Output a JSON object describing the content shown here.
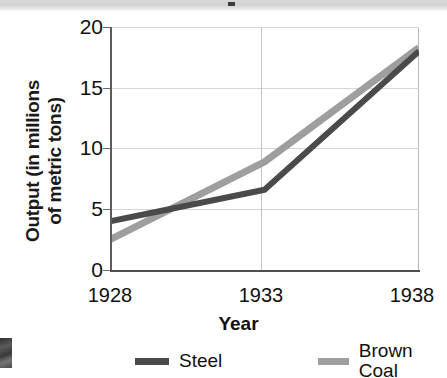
{
  "figure": {
    "title_band": {
      "visible": true,
      "note": "cut-off title strip"
    },
    "artifact": {
      "name": "scan-artifact"
    }
  },
  "chart_data": {
    "type": "line",
    "title": "",
    "xlabel": "Year",
    "ylabel": "Output (in millions of metric tons)",
    "ylabel_line1": "Output (in millions",
    "ylabel_line2": "of metric tons)",
    "x": [
      1928,
      1933,
      1938
    ],
    "categories": [
      "1928",
      "1933",
      "1938"
    ],
    "xticklabels": [
      "1928",
      "1933",
      "1938"
    ],
    "yticklabels": [
      "0",
      "5",
      "10",
      "15",
      "20"
    ],
    "yticks": [
      0,
      5,
      10,
      15,
      20
    ],
    "ylim": [
      0,
      20
    ],
    "xlim": [
      1928,
      1938
    ],
    "grid": true,
    "legend_position": "below",
    "series": [
      {
        "name": "Steel",
        "values": [
          4.0,
          6.6,
          18.0
        ],
        "color": "#4a4a4a"
      },
      {
        "name": "Brown Coal",
        "values": [
          2.5,
          8.9,
          18.3
        ],
        "color": "#9e9e9e"
      }
    ],
    "annotations": [
      "Steel and Brown Coal lines cross at about 1930 near 5 million metric tons"
    ]
  },
  "legend": {
    "items": [
      {
        "label": "Steel",
        "color": "#4a4a4a"
      },
      {
        "label": "Brown Coal",
        "color": "#9e9e9e"
      }
    ]
  }
}
